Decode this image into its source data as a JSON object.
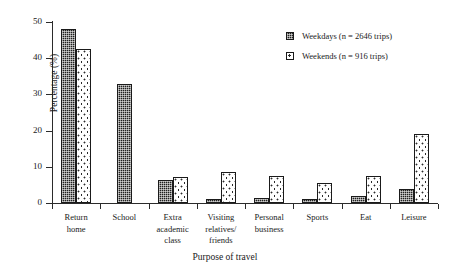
{
  "chart_data": {
    "type": "bar",
    "title": "",
    "subtitle": "",
    "xlabel": "Purpose of travel",
    "ylabel": "Percentage (%)",
    "ylim": [
      0,
      50
    ],
    "yticks": [
      "0",
      "10",
      "20",
      "30",
      "40",
      "50"
    ],
    "grid": false,
    "legend_position": "top-right",
    "categories": [
      "Return\nhome",
      "School",
      "Extra\nacademic\nclass",
      "Visiting\nrelatives/\nfriends",
      "Personal\nbusiness",
      "Sports",
      "Eat",
      "Leisure"
    ],
    "series": [
      {
        "name": "Weekdays (n = 2646 trips)",
        "short_name": "Weekdays",
        "n": 2646,
        "pattern": "dark-checker",
        "values": [
          48.0,
          33.0,
          6.4,
          1.0,
          1.5,
          1.2,
          2.0,
          4.0
        ]
      },
      {
        "name": "Weekends (n = 916 trips)",
        "short_name": "Weekends",
        "n": 916,
        "pattern": "light-speckle",
        "values": [
          42.5,
          null,
          7.1,
          8.7,
          7.6,
          5.4,
          7.4,
          19.0
        ]
      }
    ]
  },
  "colors": {
    "weekday_fill": "#20201f",
    "weekend_fill": "#ffffff",
    "axis": "#2b2b2b",
    "text": "#1a1a1a",
    "background": "#ffffff"
  }
}
